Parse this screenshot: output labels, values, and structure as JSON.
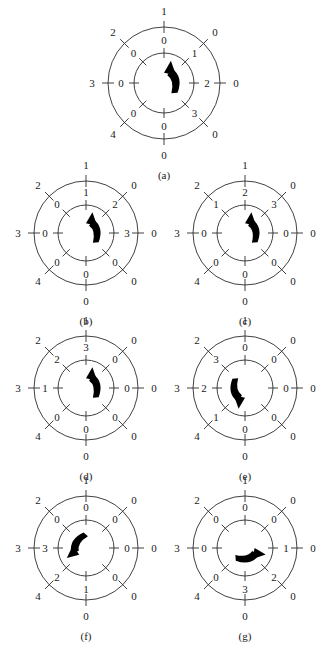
{
  "figure": {
    "type": "diagram",
    "outer_ring_labels": [
      "1",
      "0",
      "0",
      "0",
      "0",
      "4",
      "3",
      "2"
    ],
    "outer_ring_label_note": "Listed clockwise starting at the top tick.",
    "panels": [
      {
        "id": "a",
        "caption": "(a)",
        "outer": [
          "1",
          "0",
          "0",
          "0",
          "0",
          "4",
          "3",
          "2"
        ],
        "inner": [
          "0",
          "1",
          "2",
          "3",
          "0",
          "0",
          "0",
          "0"
        ],
        "arrow_angle_deg": 315,
        "cx": 164,
        "cy": 83,
        "outer_r": 56,
        "inner_r": 30
      },
      {
        "id": "b",
        "caption": "(b)",
        "outer": [
          "1",
          "0",
          "0",
          "0",
          "0",
          "4",
          "3",
          "2"
        ],
        "inner": [
          "1",
          "2",
          "3",
          "0",
          "0",
          "0",
          "0",
          "0"
        ],
        "arrow_angle_deg": 315,
        "cx": 86,
        "cy": 233,
        "outer_r": 52,
        "inner_r": 28
      },
      {
        "id": "c",
        "caption": "(c)",
        "outer": [
          "1",
          "0",
          "0",
          "0",
          "0",
          "4",
          "3",
          "2"
        ],
        "inner": [
          "2",
          "3",
          "0",
          "0",
          "0",
          "0",
          "0",
          "1"
        ],
        "arrow_angle_deg": 315,
        "cx": 245,
        "cy": 233,
        "outer_r": 52,
        "inner_r": 28
      },
      {
        "id": "d",
        "caption": "(d)",
        "outer": [
          "1",
          "0",
          "0",
          "0",
          "0",
          "4",
          "3",
          "2"
        ],
        "inner": [
          "3",
          "0",
          "0",
          "0",
          "0",
          "0",
          "1",
          "2"
        ],
        "arrow_angle_deg": 315,
        "cx": 86,
        "cy": 388,
        "outer_r": 52,
        "inner_r": 28
      },
      {
        "id": "e",
        "caption": "(e)",
        "outer": [
          "1",
          "0",
          "0",
          "0",
          "0",
          "4",
          "3",
          "2"
        ],
        "inner": [
          "0",
          "0",
          "0",
          "0",
          "0",
          "1",
          "2",
          "3"
        ],
        "arrow_angle_deg": 135,
        "cx": 245,
        "cy": 388,
        "outer_r": 52,
        "inner_r": 28
      },
      {
        "id": "f",
        "caption": "(f)",
        "outer": [
          "1",
          "0",
          "0",
          "0",
          "0",
          "4",
          "3",
          "2"
        ],
        "inner": [
          "0",
          "0",
          "0",
          "0",
          "1",
          "2",
          "3",
          "0"
        ],
        "arrow_angle_deg": 180,
        "cx": 86,
        "cy": 548,
        "outer_r": 52,
        "inner_r": 28
      },
      {
        "id": "g",
        "caption": "(g)",
        "outer": [
          "1",
          "0",
          "0",
          "0",
          "0",
          "4",
          "3",
          "2"
        ],
        "inner": [
          "0",
          "0",
          "1",
          "2",
          "3",
          "0",
          "0",
          "0"
        ],
        "arrow_angle_deg": 45,
        "cx": 245,
        "cy": 548,
        "outer_r": 52,
        "inner_r": 28
      }
    ],
    "colors": {
      "ink": "#1a1a1a",
      "stroke": "#2b2b2b",
      "background": "#ffffff"
    }
  }
}
